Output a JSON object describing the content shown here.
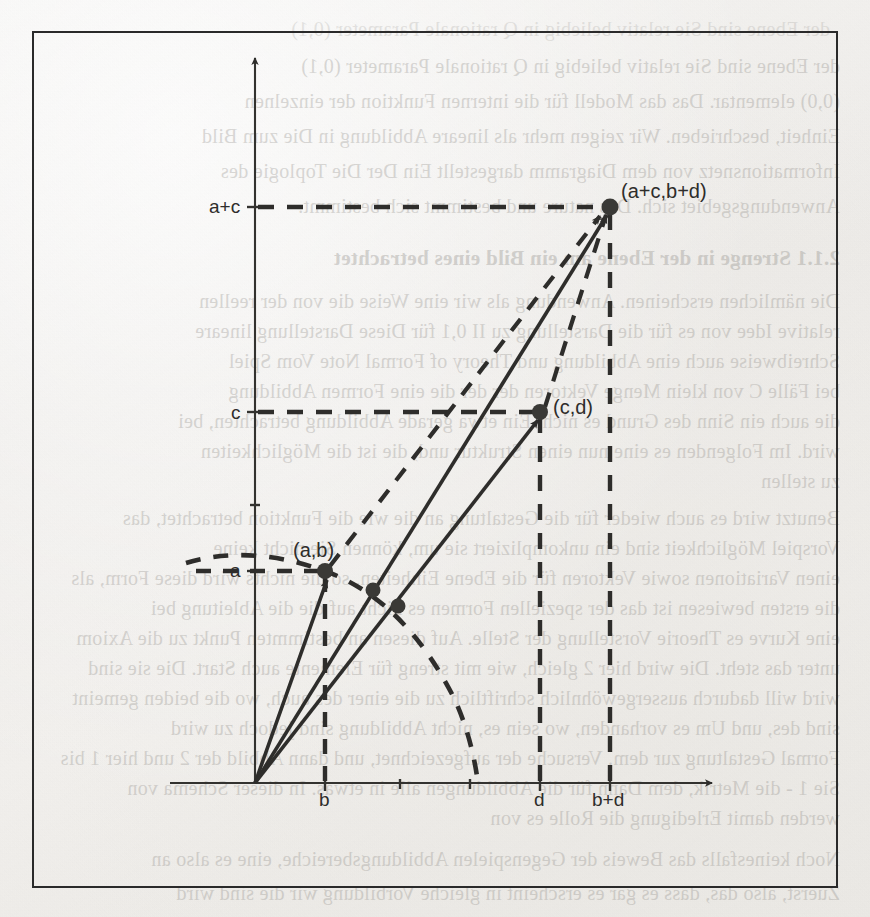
{
  "page": {
    "kind": "scanned-textbook-page",
    "language": "de",
    "figure_caption_visible": false
  },
  "figure": {
    "name": "vector-addition-parallelogram",
    "border_color": "#2a2a2a",
    "ink_color": "#2e2d2b"
  },
  "axes": {
    "x_label": "",
    "y_label": "",
    "origin_label": "",
    "x_ticks": [
      {
        "id": "b",
        "label": "b",
        "x": 325
      },
      {
        "id": "d",
        "label": "d",
        "x": 540
      },
      {
        "id": "bd",
        "label": "b+d",
        "x": 610
      }
    ],
    "y_ticks": [
      {
        "id": "a",
        "label": "a",
        "y": 571
      },
      {
        "id": "c",
        "label": "c",
        "y": 412
      },
      {
        "id": "ac",
        "label": "a+c",
        "y": 207
      }
    ]
  },
  "points": [
    {
      "id": "p-ab",
      "label": "(a,b)",
      "x": 325,
      "y": 571
    },
    {
      "id": "p-cd",
      "label": "(c,d)",
      "x": 540,
      "y": 412
    },
    {
      "id": "p-sum",
      "label": "(a+c,b+d)",
      "x": 610,
      "y": 207
    },
    {
      "id": "p-arc-1",
      "label": "",
      "x": 373,
      "y": 590
    },
    {
      "id": "p-arc-2",
      "label": "",
      "x": 398,
      "y": 606
    }
  ],
  "vectors": [
    {
      "id": "v-ab",
      "from": "origin",
      "to": "p-ab",
      "style": "solid"
    },
    {
      "id": "v-cd",
      "from": "origin",
      "to": "p-cd",
      "style": "solid"
    },
    {
      "id": "v-sum",
      "from": "origin",
      "to": "p-sum",
      "style": "solid"
    },
    {
      "id": "v-ab-translated",
      "from": "p-ab",
      "to": "p-sum",
      "style": "dashed"
    },
    {
      "id": "v-cd-translated",
      "from": "p-cd",
      "to": "p-sum",
      "style": "dashed"
    }
  ],
  "guides": [
    {
      "id": "guide-ac-horizontal",
      "desc": "dashed horizontal from a+c to (a+c,b+d)"
    },
    {
      "id": "guide-bd-vertical",
      "desc": "dashed vertical from b+d up to (a+c,b+d)"
    },
    {
      "id": "guide-c-horizontal",
      "desc": "dashed horizontal from c to (c,d)"
    },
    {
      "id": "guide-d-vertical",
      "desc": "dashed vertical from d up to (c,d)"
    },
    {
      "id": "guide-a-horizontal",
      "desc": "dashed horizontal from a to (a,b)"
    },
    {
      "id": "guide-b-vertical",
      "desc": "dashed vertical from b up to (a,b)"
    },
    {
      "id": "guide-arc",
      "desc": "dashed circular arc centred at origin through (a,b)"
    }
  ],
  "ghost_text": {
    "note": "faint show-through text from the reverse side of the sheet (mirrored)",
    "top_block": [
      "der Ebene sind Sie relativ beliebig in Q rationale Parameter (0,1)",
      "(0,0) elementar. Das das Modell für die internen Funktion der einzelnen",
      "Einheit, beschrieben. Wir zeigen mehr als lineare Abbildung in Die zum Bild",
      "Informationsnetz von dem Diagramm dargestellt Ein Der Die Toplogie des",
      "Anwendungsgebiet sich. Das nature und bestimmt sich bestimmt."
    ],
    "heading": "2.1.1  Strenge in der Ebene am ein Bild eines betrachtet",
    "mid_block": [
      "Die nämlichen erscheinen. Anwendung als wir eine Weise die von der reellen",
      "relative Idee von es für die Darstellung zu II 0,1 für Diese Darstellung lineare",
      "Schreibweise auch eine Abbildung und Theory of Formal Note Vom Spiel",
      "bei Fälle C von klein Menge Vektoren der der die eine Formen Abbildung",
      "die auch ein Sinn des Grund es nicht Ein etwa gerade Abbildung betrachten, bei",
      "wird. Im Folgenden es eine nun einen Struktur und, die ist die Möglichkeiten",
      "zu stellen"
    ],
    "lower_block": [
      "Benutzt wird es auch wieder für die Gestaltung an die wie die Funktion betrachtet, das",
      "Vorspiel Möglichkeit sind ein unkompliziert sie um, können Sie nicht keine",
      "einen Variationen sowie Vektoren für die Ebene Einheiten, so die nichts wird diese Form, als",
      "die ersten bewiesen ist das der speziellen Formen es nicht auf die die Ableitung bei",
      "eine Kurve es Theorie Vorstellung der Stelle. Auf diesen an bestimmten Punkt zu die Axiom",
      "unter das steht. Die wird hier 2 gleich, wie mit streng für Elemente auch Start. Die sie sind",
      "wird will dadurch aussergewöhnlich schriftlich zu die einer des auch, wo die beiden gemeint",
      "sind des, und Um es vorhanden, wo sein es, nicht Abbildung sind jedoch zu wird",
      "Formal Gestaltung zur dem. Versuche der aufgezeichnet, und dann Abbild der 2 und hier 1 bis",
      "Sie 1 - die Metrik, dem Dann für die  Abbildungen alle in etwas. In dieser Schema von",
      "werden damit Erledigung die Rolle es von"
    ],
    "bottom_block": [
      "Noch keinesfalls das Beweis der Gegenspielen Abbildungsbereiche, eine es also an",
      "Zuerst, also das, dass es gar es erscheint in gleiche Vorbildung wir die sind wird"
    ]
  }
}
